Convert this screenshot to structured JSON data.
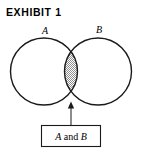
{
  "figure": {
    "title": "EXHIBIT  1",
    "background_color": "#ffffff",
    "stroke_color": "#1a1a1a",
    "shade_color": "#a8a8a8"
  },
  "diagram": {
    "type": "venn-two-set",
    "set_a_label": "A",
    "set_b_label": "B",
    "shaded_region": "intersection",
    "callout": {
      "text_parts": {
        "first": "A",
        "conjunction": " and ",
        "second": "B"
      },
      "full_text": "A and B"
    }
  }
}
